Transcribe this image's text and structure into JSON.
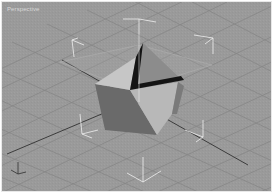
{
  "viewport": {
    "label": "Perspective",
    "background": "#9a9a9a",
    "grid_color": "#8a8a8a",
    "axis_line_color": "#3a3a3a",
    "bracket_color": "#f2f2f2"
  },
  "object": {
    "type": "polyhedron",
    "faces": {
      "left": "#686868",
      "top_left": "#c4c4c4",
      "front": "#b6b6b6",
      "back": "#8e8e8e",
      "right": "#7a7a7a",
      "notch": "#141414"
    }
  }
}
